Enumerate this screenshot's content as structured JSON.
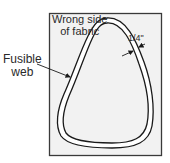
{
  "diagram": {
    "type": "appliqué preparation illustration",
    "panel": {
      "fill": "#f2f2f2",
      "stroke": "#3a3a3a"
    },
    "shape": {
      "name": "rounded teardrop",
      "stroke": "#1a1a1a",
      "fill": "#ffffff",
      "inner_fill": "#f2f2f2"
    },
    "labels": {
      "fabric_line1": "Wrong side",
      "fabric_line2": "of fabric",
      "fusible_line1": "Fusible",
      "fusible_line2": "web",
      "allowance": "1/4\""
    },
    "annotations": [
      {
        "label": "Fusible web",
        "points_to": "band between outer and inner outline"
      },
      {
        "label": "1/4\"",
        "indicates": "width of fusible web band"
      }
    ]
  }
}
